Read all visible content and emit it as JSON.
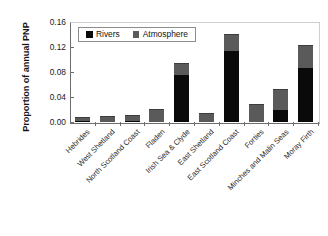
{
  "chart_data": {
    "type": "bar",
    "title": "",
    "subtitle": "",
    "xlabel": "",
    "ylabel": "Proportion of annual PNP",
    "ylim": [
      0.0,
      0.16
    ],
    "yticks": [
      "0.00",
      "0.04",
      "0.08",
      "0.12",
      "0.16"
    ],
    "ytick_values": [
      0.0,
      0.04,
      0.08,
      0.12,
      0.16
    ],
    "grid": false,
    "stacked": true,
    "legend_position": "top-left-inside",
    "categories": [
      "Hebrides",
      "West Shetland",
      "North Scotland Coast",
      "Fladen",
      "Irish Sea & Clyde",
      "East Shetland",
      "East Scotland Coast",
      "Forties",
      "Minches and Malin Seas",
      "Moray Firth"
    ],
    "series": [
      {
        "name": "Rivers",
        "color": "#0a0a0a",
        "values": [
          0.001,
          0.0,
          0.002,
          0.0,
          0.075,
          0.0,
          0.113,
          0.0,
          0.02,
          0.087
        ]
      },
      {
        "name": "Atmosphere",
        "color": "#5a5a5a",
        "values": [
          0.005,
          0.008,
          0.008,
          0.02,
          0.018,
          0.013,
          0.027,
          0.027,
          0.031,
          0.035
        ]
      }
    ],
    "totals": [
      0.006,
      0.008,
      0.01,
      0.02,
      0.093,
      0.013,
      0.14,
      0.027,
      0.051,
      0.122
    ]
  },
  "legend": {
    "items": [
      {
        "label": "Rivers",
        "color": "#0a0a0a"
      },
      {
        "label": "Atmosphere",
        "color": "#5a5a5a"
      }
    ]
  },
  "axis": {
    "y_title": "Proportion of annual PNP"
  }
}
